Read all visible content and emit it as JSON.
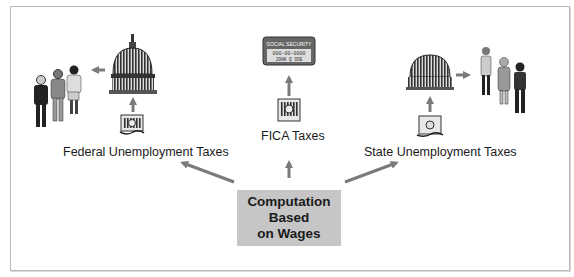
{
  "diagram": {
    "center_box": {
      "lines": [
        "Computation",
        "Based",
        "on Wages"
      ],
      "fill": "#c6c6c6"
    },
    "branches": [
      {
        "label": "Federal Unemployment Taxes",
        "icons": [
          "money-icon",
          "capitol-dome-icon",
          "unemployed-people-icon"
        ]
      },
      {
        "label": "FICA Taxes",
        "icons": [
          "money-icon",
          "social-security-card-icon"
        ]
      },
      {
        "label": "State Unemployment Taxes",
        "icons": [
          "money-icon",
          "state-dome-icon",
          "unemployed-people-icon"
        ]
      }
    ],
    "social_security_card": {
      "title": "SOCIAL SECURITY",
      "number": "000-00-0000",
      "name": "JOHN Q DOE"
    },
    "arrow_color": "#7a7a7a"
  }
}
